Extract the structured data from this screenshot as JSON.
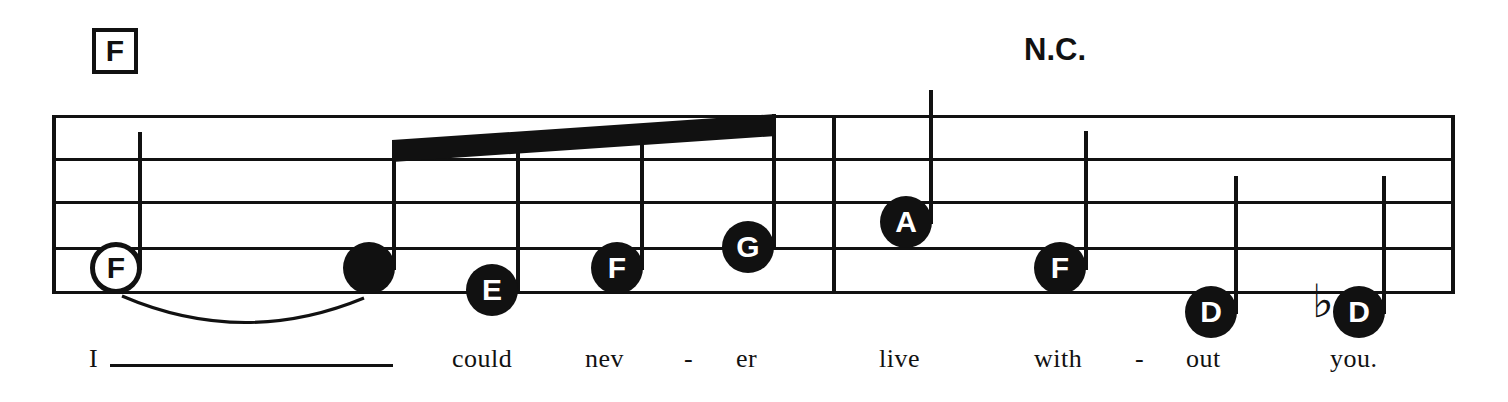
{
  "score": {
    "title_visible": false,
    "ink_color": "#111111",
    "paper_color": "#ffffff",
    "chords": [
      {
        "id": "chord-f",
        "label": "F",
        "boxed": true,
        "x": 92,
        "y": 28,
        "w": 46,
        "h": 46,
        "font_size": 30
      },
      {
        "id": "chord-nc",
        "label": "N.C.",
        "boxed": false,
        "x": 1024,
        "y": 34,
        "font_size": 31
      }
    ],
    "staff": {
      "x": 52,
      "right": 1455,
      "line_ys": [
        115,
        158,
        201,
        247,
        291
      ],
      "line_thickness": 3,
      "barlines": [
        {
          "id": "barline-start",
          "x": 52
        },
        {
          "id": "barline-middle",
          "x": 832
        },
        {
          "id": "barline-end",
          "x": 1451
        }
      ]
    },
    "beam": {
      "x1": 392,
      "y1": 140,
      "x2": 776,
      "y2": 114,
      "thickness": 22
    },
    "tie": {
      "x": 118,
      "y": 292,
      "w": 250,
      "h": 40,
      "path": "M 4 4 Q 125 56 246 6"
    },
    "notes": [
      {
        "id": "note-1",
        "letter": "F",
        "style": "hollow",
        "cx": 116,
        "cy": 268,
        "r": 26,
        "font_size": 30,
        "stem": {
          "x": 138,
          "top": 132,
          "bottom": 270
        },
        "accidental": null
      },
      {
        "id": "note-2",
        "letter": "",
        "style": "filled",
        "cx": 369,
        "cy": 268,
        "r": 26,
        "font_size": 30,
        "stem": {
          "x": 392,
          "top": 140,
          "bottom": 270
        },
        "accidental": null
      },
      {
        "id": "note-3",
        "letter": "E",
        "style": "filled",
        "cx": 492,
        "cy": 290,
        "r": 26,
        "font_size": 30,
        "stem": {
          "x": 516,
          "top": 148,
          "bottom": 292
        },
        "accidental": null
      },
      {
        "id": "note-4",
        "letter": "F",
        "style": "filled",
        "cx": 617,
        "cy": 268,
        "r": 26,
        "font_size": 30,
        "stem": {
          "x": 640,
          "top": 131,
          "bottom": 270
        },
        "accidental": null
      },
      {
        "id": "note-5",
        "letter": "G",
        "style": "filled",
        "cx": 748,
        "cy": 247,
        "r": 26,
        "font_size": 30,
        "stem": {
          "x": 772,
          "top": 114,
          "bottom": 249
        },
        "accidental": null
      },
      {
        "id": "note-6",
        "letter": "A",
        "style": "filled",
        "cx": 906,
        "cy": 222,
        "r": 26,
        "font_size": 30,
        "stem": {
          "x": 929,
          "top": 90,
          "bottom": 224
        },
        "accidental": null
      },
      {
        "id": "note-7",
        "letter": "F",
        "style": "filled",
        "cx": 1060,
        "cy": 268,
        "r": 26,
        "font_size": 30,
        "stem": {
          "x": 1084,
          "top": 131,
          "bottom": 270
        },
        "accidental": null
      },
      {
        "id": "note-8",
        "letter": "D",
        "style": "filled",
        "cx": 1211,
        "cy": 312,
        "r": 26,
        "font_size": 30,
        "stem": {
          "x": 1234,
          "top": 176,
          "bottom": 314
        },
        "accidental": null
      },
      {
        "id": "note-9",
        "letter": "D",
        "style": "filled",
        "cx": 1359,
        "cy": 312,
        "r": 26,
        "font_size": 30,
        "stem": {
          "x": 1382,
          "top": 176,
          "bottom": 314
        },
        "accidental": {
          "glyph": "♭",
          "x": 1312,
          "y": 278,
          "font_size": 46
        }
      }
    ],
    "lyrics": [
      {
        "id": "lyric-i",
        "text": "I",
        "x": 89,
        "y": 346,
        "font_size": 26,
        "extender": {
          "x": 110,
          "y": 364,
          "w": 283
        }
      },
      {
        "id": "lyric-could",
        "text": "could",
        "x": 452,
        "y": 346,
        "font_size": 26,
        "extender": null
      },
      {
        "id": "lyric-nev",
        "text": "nev",
        "x": 585,
        "y": 346,
        "font_size": 26,
        "extender": null
      },
      {
        "id": "lyric-hyph1",
        "text": "-",
        "x": 684,
        "y": 346,
        "font_size": 26,
        "extender": null
      },
      {
        "id": "lyric-er",
        "text": "er",
        "x": 736,
        "y": 346,
        "font_size": 26,
        "extender": null
      },
      {
        "id": "lyric-live",
        "text": "live",
        "x": 879,
        "y": 346,
        "font_size": 26,
        "extender": null
      },
      {
        "id": "lyric-with",
        "text": "with",
        "x": 1034,
        "y": 346,
        "font_size": 26,
        "extender": null
      },
      {
        "id": "lyric-hyph2",
        "text": "-",
        "x": 1135,
        "y": 346,
        "font_size": 26,
        "extender": null
      },
      {
        "id": "lyric-out",
        "text": "out",
        "x": 1186,
        "y": 346,
        "font_size": 26,
        "extender": null
      },
      {
        "id": "lyric-you",
        "text": "you.",
        "x": 1330,
        "y": 346,
        "font_size": 26,
        "extender": null
      }
    ]
  }
}
